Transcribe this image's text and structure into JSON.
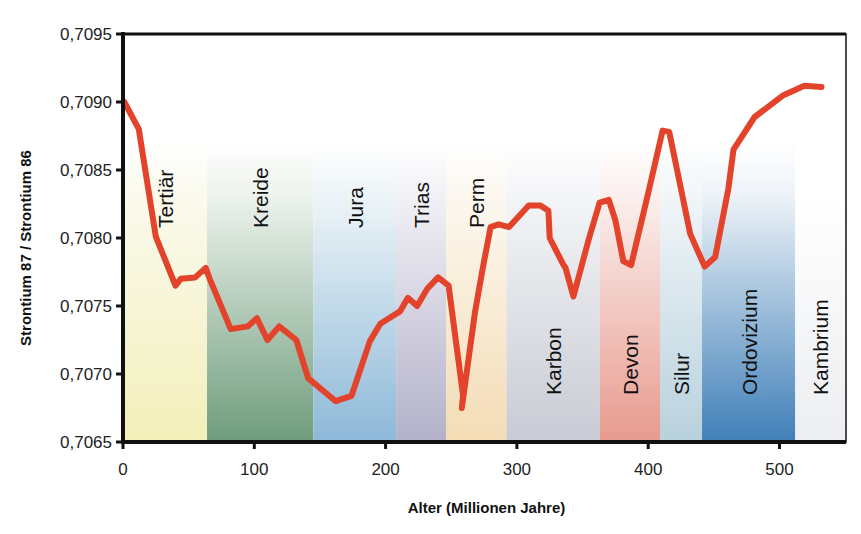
{
  "chart_data": {
    "type": "line",
    "title": "",
    "xlabel": "Alter (Millionen Jahre)",
    "ylabel": "Strontium 87 / Strontium 86",
    "xlim": [
      0,
      550
    ],
    "ylim": [
      0.7065,
      0.7095
    ],
    "x_ticks": [
      0,
      100,
      200,
      300,
      400,
      500
    ],
    "x_tick_labels": [
      "0",
      "100",
      "200",
      "300",
      "400",
      "500"
    ],
    "y_ticks": [
      0.7065,
      0.707,
      0.7075,
      0.708,
      0.7085,
      0.709,
      0.7095
    ],
    "y_tick_labels": [
      "0,7065",
      "0,7070",
      "0,7075",
      "0,7080",
      "0,7085",
      "0,7090",
      "0,7095"
    ],
    "grid": false,
    "legend": null,
    "line_color": "#e2432a",
    "series": [
      {
        "name": "Sr87/Sr86",
        "x": [
          1,
          12,
          25,
          40,
          44,
          55,
          63,
          66,
          82,
          95,
          102,
          110,
          119,
          132,
          141,
          162,
          174,
          188,
          196,
          211,
          217,
          224,
          232,
          240,
          248,
          259,
          258,
          268,
          274,
          280,
          286,
          294,
          309,
          318,
          324,
          325,
          335,
          337,
          343,
          355,
          363,
          370,
          375,
          381,
          387,
          400,
          411,
          416,
          425,
          432,
          443,
          451,
          461,
          465,
          481,
          503,
          519,
          532
        ],
        "y": [
          0.709,
          0.7088,
          0.70801,
          0.70765,
          0.7077,
          0.70771,
          0.70778,
          0.7077,
          0.70733,
          0.70735,
          0.70741,
          0.70725,
          0.70735,
          0.70725,
          0.70697,
          0.7068,
          0.70684,
          0.70724,
          0.70737,
          0.70746,
          0.70756,
          0.7075,
          0.70763,
          0.70771,
          0.70765,
          0.70684,
          0.70675,
          0.70745,
          0.70778,
          0.70808,
          0.7081,
          0.70808,
          0.70824,
          0.70824,
          0.7082,
          0.708,
          0.70781,
          0.70778,
          0.70757,
          0.708,
          0.70826,
          0.70828,
          0.70813,
          0.70783,
          0.7078,
          0.70833,
          0.70879,
          0.70878,
          0.70836,
          0.70803,
          0.70779,
          0.70786,
          0.70836,
          0.70865,
          0.70889,
          0.70905,
          0.70912,
          0.70911
        ]
      }
    ],
    "bands": [
      {
        "label": "Tertiär",
        "x0": 0,
        "x1": 64,
        "color_top": "#fbfaee",
        "color_bottom": "#f2efb9",
        "label_pos": "upper"
      },
      {
        "label": "Kreide",
        "x0": 64,
        "x1": 145,
        "color_top": "#eef3ee",
        "color_bottom": "#6f9c7c",
        "label_pos": "upper"
      },
      {
        "label": "Jura",
        "x0": 145,
        "x1": 208,
        "color_top": "#eef5f8",
        "color_bottom": "#8db8d8",
        "label_pos": "upper"
      },
      {
        "label": "Trias",
        "x0": 208,
        "x1": 246,
        "color_top": "#f2f1f6",
        "color_bottom": "#b3b1c9",
        "label_pos": "upper"
      },
      {
        "label": "Perm",
        "x0": 246,
        "x1": 292,
        "color_top": "#fcf8f0",
        "color_bottom": "#f4dcb5",
        "label_pos": "upper"
      },
      {
        "label": "Karbon",
        "x0": 292,
        "x1": 363,
        "color_top": "#f4f5f7",
        "color_bottom": "#c8cbd4",
        "label_pos": "lower"
      },
      {
        "label": "Devon",
        "x0": 363,
        "x1": 409,
        "color_top": "#fbf0ee",
        "color_bottom": "#e89a8e",
        "label_pos": "lower"
      },
      {
        "label": "Silur",
        "x0": 409,
        "x1": 441,
        "color_top": "#f1f6f8",
        "color_bottom": "#b8d1dd",
        "label_pos": "lower"
      },
      {
        "label": "Ordovizium",
        "x0": 441,
        "x1": 512,
        "color_top": "#eef3f8",
        "color_bottom": "#3f7fb8",
        "label_pos": "lower"
      },
      {
        "label": "Kambrium",
        "x0": 512,
        "x1": 550,
        "color_top": "#ffffff",
        "color_bottom": "#eceef1",
        "label_pos": "lower"
      }
    ]
  }
}
